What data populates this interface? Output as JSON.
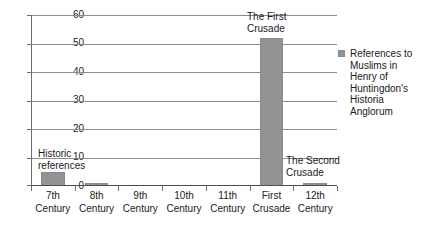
{
  "chart_data": {
    "type": "bar",
    "title": "",
    "xlabel": "",
    "ylabel": "",
    "categories": [
      "7th Century",
      "8th Century",
      "9th Century",
      "10th Century",
      "11th Century",
      "First Crusade",
      "12th Century"
    ],
    "category_lines": [
      [
        "7th",
        "Century"
      ],
      [
        "8th",
        "Century"
      ],
      [
        "9th",
        "Century"
      ],
      [
        "10th",
        "Century"
      ],
      [
        "11th",
        "Century"
      ],
      [
        "First",
        "Crusade"
      ],
      [
        "12th",
        "Century"
      ]
    ],
    "series": [
      {
        "name": "References to Muslims in Henry of Huntingdon's Historia Anglorum",
        "values": [
          5,
          1,
          0,
          0,
          0,
          52,
          1
        ]
      }
    ],
    "ylim": [
      0,
      60
    ],
    "yticks": [
      0,
      10,
      20,
      30,
      40,
      50,
      60
    ],
    "ytick_labels": [
      "0",
      "10",
      "20",
      "30",
      "40",
      "50",
      "60"
    ],
    "grid": "horizontal",
    "legend_position": "right",
    "annotations": [
      {
        "text": "Historic\nreferences",
        "category": "7th Century"
      },
      {
        "text": "The First\nCrusade",
        "category": "First Crusade"
      },
      {
        "text": "The Second\nCrusade",
        "category": "12th Century"
      }
    ],
    "colors": {
      "bar": "#939393",
      "gridline": "#8c8c8c",
      "axis": "#4d4d4d",
      "text": "#1a1a1a",
      "background": "#ffffff"
    }
  },
  "legend": {
    "lines": [
      "References to",
      "Muslims in",
      "Henry of",
      "Huntingdon's",
      "Historia",
      "Anglorum"
    ]
  }
}
